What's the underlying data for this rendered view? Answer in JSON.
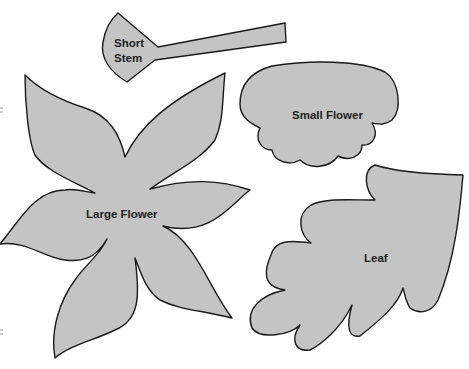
{
  "page": {
    "background": "#ffffff",
    "fill_color": "#c4c4c4",
    "outline_color": "#1a1a1a"
  },
  "templates": [
    {
      "id": "short-stem",
      "label_lines": [
        "Short",
        "Stem"
      ]
    },
    {
      "id": "small-flower",
      "label": "Small Flower"
    },
    {
      "id": "large-flower",
      "label": "Large Flower"
    },
    {
      "id": "leaf",
      "label": "Leaf"
    }
  ]
}
